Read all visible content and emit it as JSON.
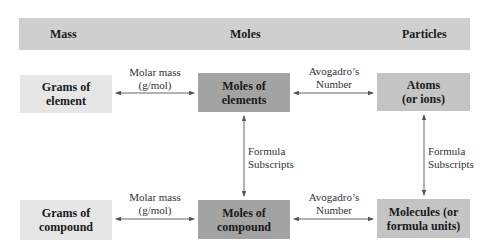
{
  "header": {
    "columns": [
      "Mass",
      "Moles",
      "Particles"
    ]
  },
  "boxes": {
    "grams_element": {
      "line1": "Grams of",
      "line2": "element"
    },
    "moles_elements": {
      "line1": "Moles of",
      "line2": "elements"
    },
    "atoms": {
      "line1": "Atoms",
      "line2": "(or ions)"
    },
    "grams_compound": {
      "line1": "Grams of",
      "line2": "compound"
    },
    "moles_compound": {
      "line1": "Moles of",
      "line2": "compound"
    },
    "molecules": {
      "line1": "Molecules (or",
      "line2": "formula units)"
    }
  },
  "conversions": {
    "molar_mass_top": {
      "line1": "Molar mass",
      "line2": "(g/mol)"
    },
    "avogadro_top": {
      "line1": "Avogadro’s",
      "line2": "Number"
    },
    "formula_left": {
      "line1": "Formula",
      "line2": "Subscripts"
    },
    "formula_right": {
      "line1": "Formula",
      "line2": "Subscripts"
    },
    "molar_mass_bottom": {
      "line1": "Molar mass",
      "line2": "(g/mol)"
    },
    "avogadro_bottom": {
      "line1": "Avogadro’s",
      "line2": "Number"
    }
  },
  "colors": {
    "header": "#cfcfcf",
    "mass_box": "#e6e6e6",
    "moles_box": "#a3a3a3",
    "particles_box": "#c4c4c4",
    "arrow": "#555555"
  }
}
